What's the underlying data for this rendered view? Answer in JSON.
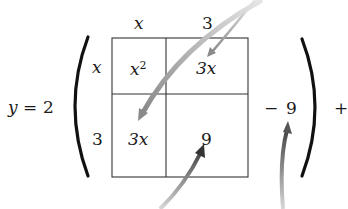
{
  "equation": {
    "lhs_var": "y",
    "equals": "=",
    "coefficient": "2",
    "minus": "−",
    "constant": "9",
    "trailing_plus": "+"
  },
  "area_model": {
    "column_headers": [
      "x",
      "3"
    ],
    "row_headers": [
      "x",
      "3"
    ],
    "cells": [
      {
        "base": "x",
        "exp": "2"
      },
      {
        "text": "3x"
      },
      {
        "text": "3x"
      },
      {
        "text": "9"
      }
    ]
  },
  "annotations": {
    "arrow_color_dark": "#555555",
    "arrow_color_light": "#cfcfcf",
    "arrows": [
      "from top-right to top-right cell 3x",
      "from top-right curving to bottom-left cell 3x",
      "from bottom to bottom-right cell 9",
      "from bottom to constant −9"
    ]
  }
}
